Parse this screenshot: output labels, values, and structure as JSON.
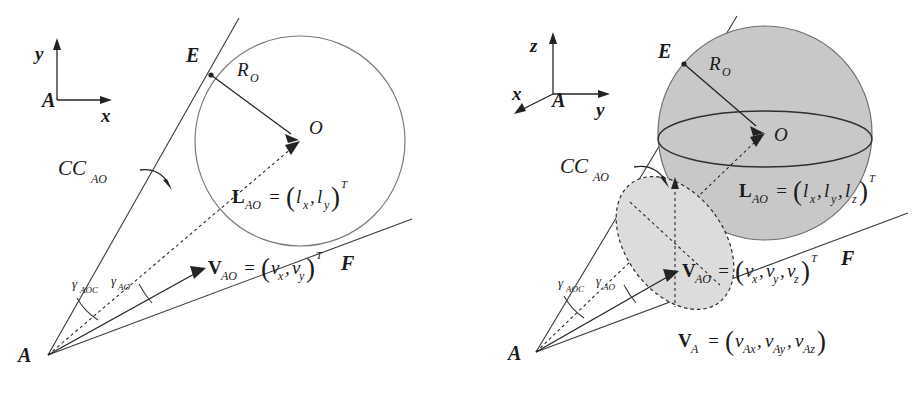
{
  "figure": {
    "background_color": "#ffffff",
    "ink_color": "#232323",
    "sphere_fill_color": "#c8c8c8",
    "cone_disc_fill_color": "#dcdcdc",
    "circle_outline_color": "#7a7a7a"
  },
  "panels": [
    {
      "id": "panel-2d",
      "name": "two-dimensional-collision-cone",
      "axes": {
        "origin_label": "A",
        "vertical_axis_label": "y",
        "horizontal_axis_label": "x",
        "axis_count": 2
      },
      "labels": {
        "apex": "A",
        "tangent_point_upper": "E",
        "tangent_point_lower": "F",
        "obstacle_center": "O",
        "radius": "R",
        "radius_sub": "O",
        "collision_cone": "CC",
        "collision_cone_sub": "AO",
        "angle_cone_half": "γ",
        "angle_cone_half_sub": "AOC",
        "angle_los": "γ",
        "angle_los_sub": "AO"
      },
      "equations": [
        {
          "name": "line-of-sight-vector",
          "lhs_bold": "L",
          "lhs_sub": "AO",
          "eq": "=",
          "open_paren": "(",
          "components": [
            "l",
            "l"
          ],
          "component_subs": [
            "x",
            "y"
          ],
          "separators": [
            ","
          ],
          "close_paren": ")",
          "superscript": "T",
          "plain": "L_AO = (l_x, l_y)^T"
        },
        {
          "name": "relative-velocity-vector",
          "lhs_bold": "V",
          "lhs_sub": "AO",
          "eq": "=",
          "open_paren": "(",
          "components": [
            "v",
            "v"
          ],
          "component_subs": [
            "x",
            "y"
          ],
          "separators": [
            ","
          ],
          "close_paren": ")",
          "superscript": "T",
          "plain": "V_AO = (v_x, v_y)^T"
        }
      ]
    },
    {
      "id": "panel-3d",
      "name": "three-dimensional-collision-cone",
      "axes": {
        "origin_label": "A",
        "vertical_axis_label": "z",
        "horizontal_axis_label": "y",
        "depth_axis_label": "x",
        "axis_count": 3
      },
      "labels": {
        "apex": "A",
        "tangent_point_upper": "E",
        "tangent_point_lower": "F",
        "obstacle_center": "O",
        "radius": "R",
        "radius_sub": "O",
        "collision_cone": "CC",
        "collision_cone_sub": "AO",
        "angle_cone_half": "γ",
        "angle_cone_half_sub": "AOC",
        "angle_los": "γ",
        "angle_los_sub": "AO"
      },
      "equations": [
        {
          "name": "line-of-sight-vector",
          "lhs_bold": "L",
          "lhs_sub": "AO",
          "eq": "=",
          "open_paren": "(",
          "components": [
            "l",
            "l",
            "l"
          ],
          "component_subs": [
            "x",
            "y",
            "z"
          ],
          "separators": [
            ",",
            ","
          ],
          "close_paren": ")",
          "superscript": "T",
          "plain": "L_AO = (l_x, l_y, l_z)^T"
        },
        {
          "name": "relative-velocity-vector",
          "lhs_bold": "V",
          "lhs_sub": "AO",
          "eq": "=",
          "open_paren": "(",
          "components": [
            "v",
            "v",
            "v"
          ],
          "component_subs": [
            "x",
            "y",
            "z"
          ],
          "separators": [
            ",",
            ","
          ],
          "close_paren": ")",
          "superscript": "T",
          "plain": "V_AO = (v_x, v_y, v_z)^T"
        },
        {
          "name": "own-velocity-vector",
          "lhs_bold": "V",
          "lhs_sub": "A",
          "eq": "=",
          "open_paren": "(",
          "components": [
            "v",
            "v",
            "v"
          ],
          "component_subs": [
            "Ax",
            "Ay",
            "Az"
          ],
          "separators": [
            ",",
            ","
          ],
          "close_paren": ")",
          "superscript": "",
          "plain": "V_A = (v_Ax, v_Ay, v_Az)"
        }
      ]
    }
  ]
}
